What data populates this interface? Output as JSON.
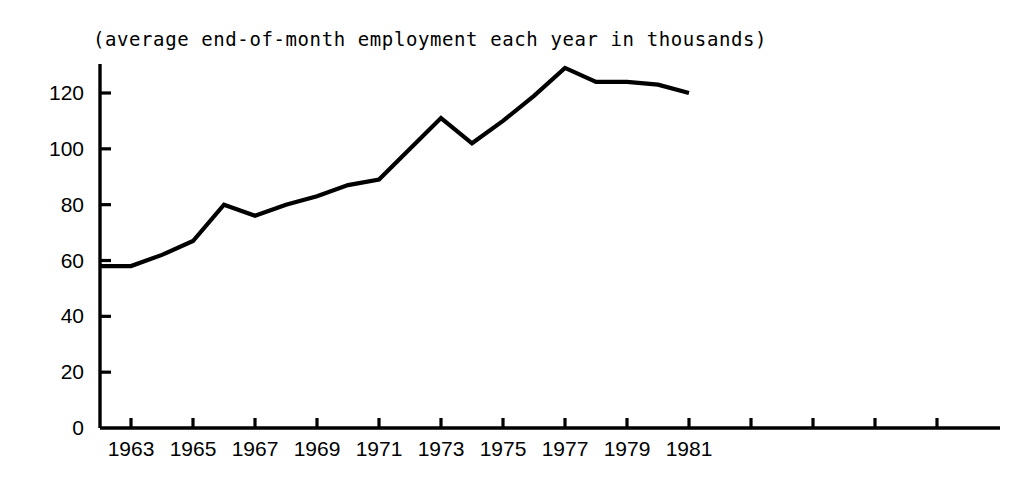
{
  "chart_data": {
    "type": "line",
    "title": "(average end-of-month employment each year in thousands)",
    "xlabel": "",
    "ylabel": "",
    "grid": false,
    "legend": "none",
    "line_color": "#000000",
    "axis_color": "#000000",
    "background": "#ffffff",
    "xlim": [
      1962,
      1982
    ],
    "ylim": [
      0,
      134
    ],
    "ytick_values": [
      0,
      20,
      40,
      60,
      80,
      100,
      120
    ],
    "ytick_labels": [
      "0",
      "20",
      "40",
      "60",
      "80",
      "100",
      "120"
    ],
    "xtick_values": [
      1963,
      1965,
      1967,
      1969,
      1971,
      1973,
      1975,
      1977,
      1979,
      1981
    ],
    "xtick_labels": [
      "1963",
      "1965",
      "1967",
      "1969",
      "1971",
      "1973",
      "1975",
      "1977",
      "1979",
      "1981"
    ],
    "x": [
      1962,
      1963,
      1964,
      1965,
      1966,
      1967,
      1968,
      1969,
      1970,
      1971,
      1972,
      1973,
      1974,
      1975,
      1976,
      1977,
      1978,
      1979,
      1980,
      1981
    ],
    "values": [
      58,
      58,
      62,
      67,
      80,
      76,
      80,
      83,
      87,
      89,
      100,
      111,
      102,
      110,
      119,
      129,
      124,
      124,
      123,
      120
    ],
    "series": [
      {
        "name": "employment",
        "values": [
          58,
          58,
          62,
          67,
          80,
          76,
          80,
          83,
          87,
          89,
          100,
          111,
          102,
          110,
          119,
          129,
          124,
          124,
          123,
          120
        ]
      }
    ]
  }
}
